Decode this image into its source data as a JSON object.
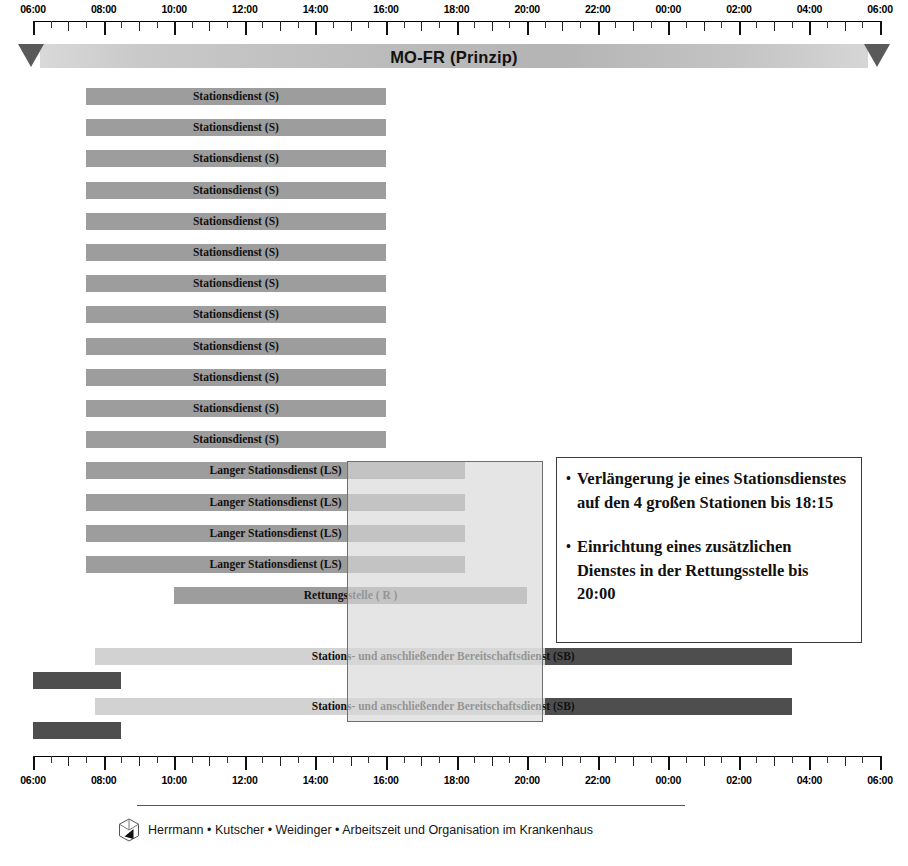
{
  "banner": {
    "title": "MO-FR (Prinzip)",
    "left_arrow_icon": "triangle-down-icon",
    "right_arrow_icon": "triangle-down-icon"
  },
  "axis": {
    "start_time": "06:00",
    "end_time": "06:00",
    "tick_labels": [
      "06:00",
      "08:00",
      "10:00",
      "12:00",
      "14:00",
      "16:00",
      "18:00",
      "20:00",
      "22:00",
      "00:00",
      "02:00",
      "04:00",
      "06:00"
    ],
    "tick_hours": [
      6,
      8,
      10,
      12,
      14,
      16,
      18,
      20,
      22,
      24,
      26,
      28,
      30
    ],
    "minor_tick_interval_minutes": 30
  },
  "colors": {
    "bar_medium": "#9d9d9d",
    "bar_light": "#d2d2d2",
    "bar_dark": "#4e4e4e",
    "banner_gradient_start": "#d9d9d9",
    "banner_gradient_end": "#d6d6d6",
    "arrow": "#5a5a5a",
    "overlay_fill": "#d7d7d7",
    "callout_border": "#3a3a3a",
    "text": "#111111"
  },
  "chart_data": {
    "type": "bar",
    "title": "MO-FR (Prinzip)",
    "xlabel": "",
    "ylabel": "",
    "xlim": [
      6,
      30
    ],
    "x_tick_labels": [
      "06:00",
      "08:00",
      "10:00",
      "12:00",
      "14:00",
      "16:00",
      "18:00",
      "20:00",
      "22:00",
      "00:00",
      "02:00",
      "04:00",
      "06:00"
    ],
    "grid": false,
    "legend_position": "none",
    "orientation": "horizontal",
    "note": "Gantt-style shift schedule; x values are clock hours from 06:00 (6) to 06:00 next day (30).",
    "categories": [
      "Stationsdienst (S)",
      "Stationsdienst (S)",
      "Stationsdienst (S)",
      "Stationsdienst (S)",
      "Stationsdienst (S)",
      "Stationsdienst (S)",
      "Stationsdienst (S)",
      "Stationsdienst (S)",
      "Stationsdienst (S)",
      "Stationsdienst (S)",
      "Stationsdienst (S)",
      "Stationsdienst (S)",
      "Langer Stationsdienst (LS)",
      "Langer Stationsdienst (LS)",
      "Langer Stationsdienst (LS)",
      "Langer Stationsdienst (LS)",
      "Rettungsstelle ( R )",
      "Stations- und anschließender Bereitschaftsdienst (SB)",
      "Stations- und anschließender Bereitschaftsdienst (SB)"
    ],
    "bars": [
      {
        "label": "Stationsdienst (S)",
        "start": 7.5,
        "end": 16.0,
        "shade": "medium"
      },
      {
        "label": "Stationsdienst (S)",
        "start": 7.5,
        "end": 16.0,
        "shade": "medium"
      },
      {
        "label": "Stationsdienst (S)",
        "start": 7.5,
        "end": 16.0,
        "shade": "medium"
      },
      {
        "label": "Stationsdienst (S)",
        "start": 7.5,
        "end": 16.0,
        "shade": "medium"
      },
      {
        "label": "Stationsdienst (S)",
        "start": 7.5,
        "end": 16.0,
        "shade": "medium"
      },
      {
        "label": "Stationsdienst (S)",
        "start": 7.5,
        "end": 16.0,
        "shade": "medium"
      },
      {
        "label": "Stationsdienst (S)",
        "start": 7.5,
        "end": 16.0,
        "shade": "medium"
      },
      {
        "label": "Stationsdienst (S)",
        "start": 7.5,
        "end": 16.0,
        "shade": "medium"
      },
      {
        "label": "Stationsdienst (S)",
        "start": 7.5,
        "end": 16.0,
        "shade": "medium"
      },
      {
        "label": "Stationsdienst (S)",
        "start": 7.5,
        "end": 16.0,
        "shade": "medium"
      },
      {
        "label": "Stationsdienst (S)",
        "start": 7.5,
        "end": 16.0,
        "shade": "medium"
      },
      {
        "label": "Stationsdienst (S)",
        "start": 7.5,
        "end": 16.0,
        "shade": "medium"
      },
      {
        "label": "Langer Stationsdienst (LS)",
        "start": 7.5,
        "end": 18.25,
        "shade": "medium"
      },
      {
        "label": "Langer Stationsdienst (LS)",
        "start": 7.5,
        "end": 18.25,
        "shade": "medium"
      },
      {
        "label": "Langer Stationsdienst (LS)",
        "start": 7.5,
        "end": 18.25,
        "shade": "medium"
      },
      {
        "label": "Langer Stationsdienst (LS)",
        "start": 7.5,
        "end": 18.25,
        "shade": "medium"
      },
      {
        "label": "Rettungsstelle ( R )",
        "start": 10.0,
        "end": 20.0,
        "shade": "medium"
      },
      {
        "label": "Stations- und anschließender Bereitschaftsdienst (SB)",
        "start": 7.75,
        "end": 27.5,
        "shade": "split",
        "dark_from": 20.5
      },
      {
        "label": "Stations- und anschließender Bereitschaftsdienst (SB)",
        "start": 7.75,
        "end": 27.5,
        "shade": "split",
        "dark_from": 20.5
      }
    ],
    "night_tail_bars": [
      {
        "start": 6.0,
        "end": 8.5,
        "shade": "dark"
      },
      {
        "start": 6.0,
        "end": 8.5,
        "shade": "dark"
      }
    ]
  },
  "callout": {
    "items": [
      {
        "bullet": "•",
        "text": "Verlängerung je eines Stationsdienstes auf den 4 großen Stationen bis 18:15"
      },
      {
        "bullet": "•",
        "text": "Einrichtung eines zusätzlichen Dienstes in der Rettungsstelle bis 20:00"
      }
    ]
  },
  "footer": {
    "logo_icon": "cube-play-logo-icon",
    "credit": "Herrmann • Kutscher • Weidinger • Arbeitszeit und Organisation im Krankenhaus"
  }
}
